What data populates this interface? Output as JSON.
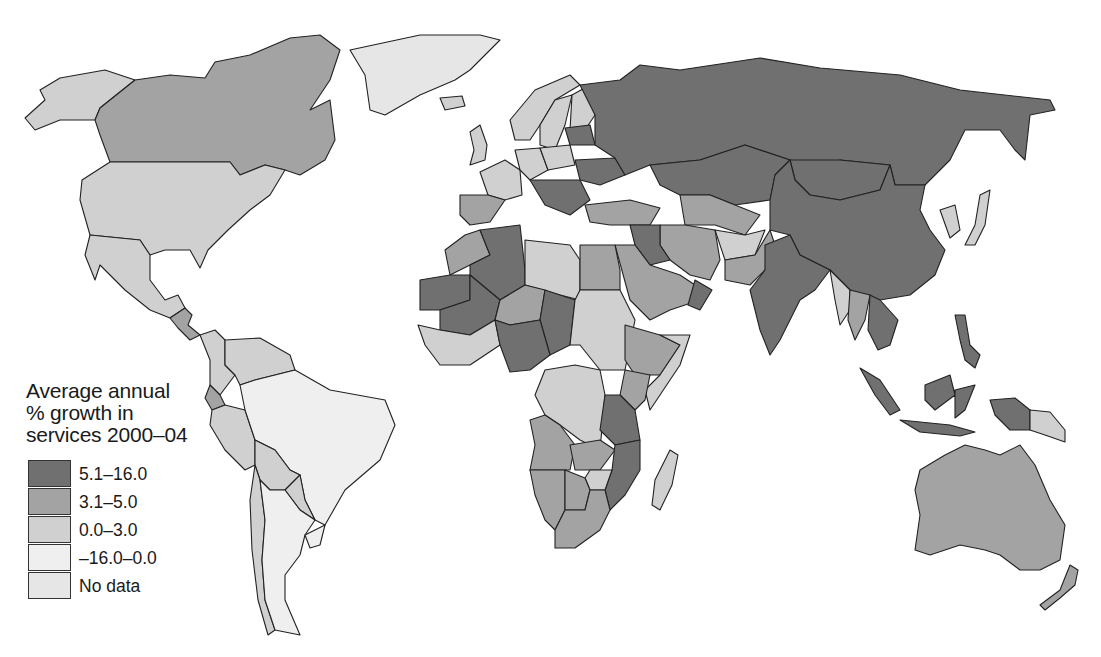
{
  "legend": {
    "title_lines": [
      "Average annual",
      "% growth in",
      "services 2000–04"
    ],
    "classes": [
      {
        "key": "c1",
        "label": "5.1–16.0",
        "color": "#707070"
      },
      {
        "key": "c2",
        "label": "3.1–5.0",
        "color": "#a3a3a3"
      },
      {
        "key": "c3",
        "label": "0.0–3.0",
        "color": "#d0d0d0"
      },
      {
        "key": "c4",
        "label": "–16.0–0.0",
        "color": "#efefef"
      },
      {
        "key": "c5",
        "label": "No data",
        "color": "#e6e6e6"
      }
    ]
  },
  "colors": {
    "background": "#ffffff",
    "border": "#222222",
    "c1": "#707070",
    "c2": "#a3a3a3",
    "c3": "#d0d0d0",
    "c4": "#efefef",
    "c5": "#e6e6e6"
  },
  "regions": [
    {
      "name": "Alaska (USA)",
      "class": "c3"
    },
    {
      "name": "Canada",
      "class": "c2"
    },
    {
      "name": "Greenland",
      "class": "c5"
    },
    {
      "name": "United States",
      "class": "c3"
    },
    {
      "name": "Mexico",
      "class": "c3"
    },
    {
      "name": "Central America",
      "class": "c2"
    },
    {
      "name": "Colombia",
      "class": "c3"
    },
    {
      "name": "Venezuela",
      "class": "c3"
    },
    {
      "name": "Ecuador",
      "class": "c2"
    },
    {
      "name": "Peru",
      "class": "c3"
    },
    {
      "name": "Brazil",
      "class": "c4"
    },
    {
      "name": "Bolivia",
      "class": "c3"
    },
    {
      "name": "Paraguay",
      "class": "c3"
    },
    {
      "name": "Chile",
      "class": "c3"
    },
    {
      "name": "Argentina",
      "class": "c4"
    },
    {
      "name": "Uruguay",
      "class": "c4"
    },
    {
      "name": "Iceland",
      "class": "c3"
    },
    {
      "name": "Norway",
      "class": "c3"
    },
    {
      "name": "Sweden",
      "class": "c3"
    },
    {
      "name": "Finland",
      "class": "c3"
    },
    {
      "name": "United Kingdom",
      "class": "c3"
    },
    {
      "name": "France",
      "class": "c3"
    },
    {
      "name": "Spain",
      "class": "c2"
    },
    {
      "name": "Germany",
      "class": "c3"
    },
    {
      "name": "Poland",
      "class": "c3"
    },
    {
      "name": "Ukraine",
      "class": "c1"
    },
    {
      "name": "Baltics",
      "class": "c1"
    },
    {
      "name": "Balkans",
      "class": "c1"
    },
    {
      "name": "Russia",
      "class": "c1"
    },
    {
      "name": "Kazakhstan",
      "class": "c1"
    },
    {
      "name": "Mongolia",
      "class": "c1"
    },
    {
      "name": "China",
      "class": "c1"
    },
    {
      "name": "Korea",
      "class": "c3"
    },
    {
      "name": "Japan",
      "class": "c3"
    },
    {
      "name": "Turkey",
      "class": "c2"
    },
    {
      "name": "Central Asia",
      "class": "c2"
    },
    {
      "name": "Iran",
      "class": "c2"
    },
    {
      "name": "Afghanistan",
      "class": "c3"
    },
    {
      "name": "Pakistan",
      "class": "c2"
    },
    {
      "name": "India",
      "class": "c1"
    },
    {
      "name": "Saudi Arabia",
      "class": "c2"
    },
    {
      "name": "Oman",
      "class": "c1"
    },
    {
      "name": "Iraq",
      "class": "c1"
    },
    {
      "name": "Myanmar",
      "class": "c3"
    },
    {
      "name": "Thailand",
      "class": "c2"
    },
    {
      "name": "Vietnam",
      "class": "c1"
    },
    {
      "name": "Indonesia",
      "class": "c1"
    },
    {
      "name": "Philippines",
      "class": "c1"
    },
    {
      "name": "Papua New Guinea",
      "class": "c3"
    },
    {
      "name": "Australia",
      "class": "c2"
    },
    {
      "name": "New Zealand",
      "class": "c2"
    },
    {
      "name": "Morocco",
      "class": "c2"
    },
    {
      "name": "Algeria",
      "class": "c1"
    },
    {
      "name": "Libya",
      "class": "c3"
    },
    {
      "name": "Egypt",
      "class": "c2"
    },
    {
      "name": "Mauritania",
      "class": "c1"
    },
    {
      "name": "Mali",
      "class": "c1"
    },
    {
      "name": "Niger",
      "class": "c2"
    },
    {
      "name": "Chad",
      "class": "c1"
    },
    {
      "name": "Sudan",
      "class": "c3"
    },
    {
      "name": "Nigeria",
      "class": "c1"
    },
    {
      "name": "Ethiopia",
      "class": "c2"
    },
    {
      "name": "Somalia",
      "class": "c3"
    },
    {
      "name": "West Africa coast",
      "class": "c3"
    },
    {
      "name": "DR Congo",
      "class": "c3"
    },
    {
      "name": "Kenya",
      "class": "c2"
    },
    {
      "name": "Tanzania",
      "class": "c1"
    },
    {
      "name": "Angola",
      "class": "c2"
    },
    {
      "name": "Zambia",
      "class": "c2"
    },
    {
      "name": "Mozambique",
      "class": "c1"
    },
    {
      "name": "Namibia",
      "class": "c2"
    },
    {
      "name": "Botswana",
      "class": "c2"
    },
    {
      "name": "Zimbabwe",
      "class": "c3"
    },
    {
      "name": "South Africa",
      "class": "c2"
    },
    {
      "name": "Madagascar",
      "class": "c3"
    }
  ]
}
